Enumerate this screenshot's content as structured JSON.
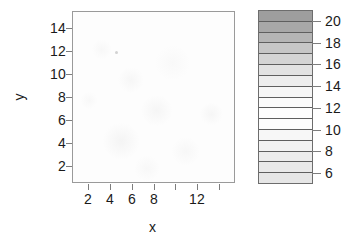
{
  "figure": {
    "background_color": "#ffffff",
    "panel_border_color": "#9a9a9a",
    "tick_color": "#7d7d7d",
    "text_color": "#1a1a1a"
  },
  "axes": {
    "x": {
      "title": "x",
      "tick_values": [
        2,
        4,
        6,
        8,
        10,
        12,
        14
      ],
      "tick_labels": [
        "2",
        "4",
        "6",
        "8",
        "",
        "12",
        ""
      ],
      "range": [
        0.5,
        15.5
      ]
    },
    "y": {
      "title": "y",
      "tick_values": [
        2,
        4,
        6,
        8,
        10,
        12,
        14
      ],
      "tick_labels": [
        "14",
        "12",
        "10",
        "8",
        "6",
        "4",
        "2"
      ],
      "range": [
        0.5,
        15.5
      ]
    }
  },
  "legend": {
    "name": "color-key",
    "orientation": "vertical",
    "tick_labels": [
      "20",
      "18",
      "16",
      "14",
      "12",
      "10",
      "8",
      "6"
    ],
    "tick_values": [
      20,
      18,
      16,
      14,
      12,
      10,
      8,
      6
    ],
    "range": [
      5,
      21
    ],
    "band_colors": [
      "#9e9e9e",
      "#a8a8a8",
      "#b5b5b5",
      "#c6c6c6",
      "#d4d4d4",
      "#e2e2e2",
      "#ededed",
      "#f6f6f6",
      "#fbfbfb",
      "#fdfdfd",
      "#fcfcfc",
      "#f7f7f7",
      "#f2f2f2",
      "#ececec",
      "#e9e9e9",
      "#e6e6e6"
    ],
    "border_color": "#6d6d6d"
  },
  "chart_data": {
    "type": "heatmap",
    "title": "",
    "subtitle": "",
    "xlabel": "x",
    "ylabel": "y",
    "xlim": [
      0.5,
      15.5
    ],
    "ylim": [
      0.5,
      15.5
    ],
    "zlim": [
      5,
      21
    ],
    "grid": false,
    "legend_position": "right",
    "colormap": "grey",
    "x": [
      1,
      2,
      3,
      4,
      5,
      6,
      7,
      8,
      9,
      10,
      11,
      12,
      13,
      14,
      15
    ],
    "y": [
      1,
      2,
      3,
      4,
      5,
      6,
      7,
      8,
      9,
      10,
      11,
      12,
      13,
      14,
      15
    ],
    "xticks": [
      2,
      4,
      6,
      8,
      10,
      12,
      14
    ],
    "xticklabels": [
      "2",
      "4",
      "6",
      "8",
      "",
      "12",
      ""
    ],
    "yticks": [
      2,
      4,
      6,
      8,
      10,
      12,
      14
    ],
    "yticklabels": [
      "2",
      "4",
      "6",
      "8",
      "10",
      "12",
      "14"
    ],
    "colorbar_ticks": [
      6,
      8,
      10,
      12,
      14,
      16,
      18,
      20
    ],
    "colorbar_ticklabels": [
      "6",
      "8",
      "10",
      "12",
      "14",
      "16",
      "18",
      "20"
    ],
    "note": "Nearly uniform low-value field; all cells render near the bottom (lightest) end of the 5-21 grey scale.",
    "z": [
      [
        6.1,
        6.0,
        5.9,
        6.0,
        6.2,
        6.1,
        6.0,
        5.9,
        6.0,
        6.1,
        6.2,
        6.1,
        6.0,
        5.9,
        6.0
      ],
      [
        6.0,
        6.2,
        6.3,
        6.1,
        6.0,
        5.9,
        6.1,
        6.2,
        6.1,
        6.0,
        6.1,
        6.3,
        6.2,
        6.0,
        5.9
      ],
      [
        5.9,
        6.1,
        6.4,
        6.3,
        6.1,
        6.0,
        6.2,
        6.4,
        6.3,
        6.1,
        6.0,
        6.2,
        6.3,
        6.1,
        6.0
      ],
      [
        6.0,
        6.3,
        6.5,
        6.4,
        6.2,
        6.1,
        6.3,
        6.5,
        6.4,
        6.2,
        6.1,
        6.3,
        6.4,
        6.2,
        6.0
      ],
      [
        6.2,
        6.4,
        6.6,
        6.5,
        6.3,
        6.2,
        6.4,
        6.6,
        6.5,
        6.3,
        6.2,
        6.4,
        6.5,
        6.3,
        6.1
      ],
      [
        6.3,
        6.5,
        6.7,
        6.6,
        6.4,
        6.3,
        6.5,
        6.7,
        6.6,
        6.4,
        6.3,
        6.5,
        6.6,
        6.4,
        6.2
      ],
      [
        6.2,
        6.4,
        6.6,
        6.8,
        6.6,
        6.4,
        6.6,
        6.8,
        6.7,
        6.5,
        6.3,
        6.5,
        6.7,
        6.5,
        6.2
      ],
      [
        6.1,
        6.3,
        6.5,
        6.7,
        6.9,
        6.6,
        6.5,
        6.7,
        6.6,
        6.4,
        6.2,
        6.4,
        6.6,
        6.4,
        6.1
      ],
      [
        6.0,
        6.2,
        6.4,
        6.6,
        7.2,
        6.5,
        6.3,
        6.5,
        6.4,
        6.2,
        6.1,
        6.3,
        6.5,
        6.3,
        6.0
      ],
      [
        5.9,
        6.1,
        6.3,
        6.4,
        6.5,
        6.3,
        6.2,
        6.3,
        6.2,
        6.1,
        6.0,
        6.2,
        6.3,
        6.1,
        5.9
      ],
      [
        5.9,
        6.0,
        6.2,
        6.3,
        6.3,
        6.2,
        6.1,
        6.2,
        6.1,
        6.0,
        5.9,
        6.1,
        6.2,
        6.0,
        5.9
      ],
      [
        6.0,
        6.1,
        6.2,
        6.2,
        6.2,
        6.1,
        6.0,
        6.1,
        6.0,
        5.9,
        5.9,
        6.0,
        6.1,
        6.0,
        5.9
      ],
      [
        6.0,
        6.1,
        6.1,
        6.1,
        6.1,
        6.0,
        6.0,
        6.0,
        6.0,
        5.9,
        5.9,
        6.0,
        6.0,
        5.9,
        5.9
      ],
      [
        5.9,
        6.0,
        6.0,
        6.0,
        6.0,
        6.0,
        5.9,
        5.9,
        5.9,
        5.9,
        5.9,
        5.9,
        6.0,
        5.9,
        5.9
      ],
      [
        5.9,
        5.9,
        6.0,
        6.0,
        5.9,
        5.9,
        5.9,
        5.9,
        5.9,
        5.9,
        5.9,
        5.9,
        5.9,
        5.9,
        5.9
      ]
    ]
  }
}
